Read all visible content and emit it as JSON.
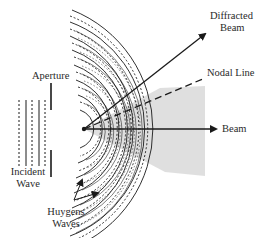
{
  "diagram": {
    "type": "wave-diffraction-through-aperture",
    "labels": {
      "aperture": "Aperture",
      "incident_wave_line1": "Incident",
      "incident_wave_line2": "Wave",
      "huygens_waves_line1": "Huygens",
      "huygens_waves_line2": "Waves",
      "diffracted_beam_line1": "Diffracted",
      "diffracted_beam_line2": "Beam",
      "nodal_line": "Nodal Line",
      "beam": "Beam"
    },
    "colors": {
      "line": "#1a1a1a",
      "shade": "#d9d9d9",
      "text": "#2a2a2a",
      "background": "#ffffff"
    },
    "geometry": {
      "origin": [
        84,
        129
      ],
      "beam_arrow_end": [
        218,
        129
      ],
      "diffracted_beam_arrow_end": [
        206,
        33
      ],
      "nodal_line_end": [
        204,
        78
      ],
      "aperture_x": 51,
      "incident_wave_x": [
        19,
        26,
        32,
        39,
        45
      ]
    }
  }
}
